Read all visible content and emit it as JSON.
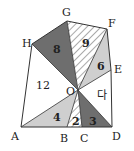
{
  "figure": {
    "width": 134,
    "height": 151,
    "colors": {
      "dark": "#6e6e6e",
      "light": "#cfcfcf",
      "hatch": "#555555",
      "stroke": "#333333",
      "background": "#ffffff"
    },
    "points": {
      "A": {
        "label": "A",
        "x": 21,
        "y": 127
      },
      "B": {
        "label": "B",
        "x": 67,
        "y": 127
      },
      "C": {
        "label": "C",
        "x": 82,
        "y": 127
      },
      "D": {
        "label": "D",
        "x": 112,
        "y": 127
      },
      "E": {
        "label": "E",
        "x": 111,
        "y": 70
      },
      "F": {
        "label": "F",
        "x": 107,
        "y": 29
      },
      "G": {
        "label": "G",
        "x": 67,
        "y": 21
      },
      "H": {
        "label": "H",
        "x": 32,
        "y": 44
      },
      "O": {
        "label": "O",
        "x": 78,
        "y": 90
      }
    },
    "regions": [
      {
        "name": "HGO",
        "fill": "dark",
        "value": "8"
      },
      {
        "name": "GFO",
        "fill": "hatch",
        "value": "9"
      },
      {
        "name": "FEO",
        "fill": "light",
        "value": "6"
      },
      {
        "name": "ABO",
        "fill": "light",
        "value": "4"
      },
      {
        "name": "BCO",
        "fill": "hatch",
        "value": "2"
      },
      {
        "name": "CDO",
        "fill": "dark",
        "value": "3"
      },
      {
        "name": "AOH",
        "fill": "none",
        "value": "12"
      },
      {
        "name": "EOD",
        "fill": "none",
        "value": "다"
      }
    ]
  }
}
